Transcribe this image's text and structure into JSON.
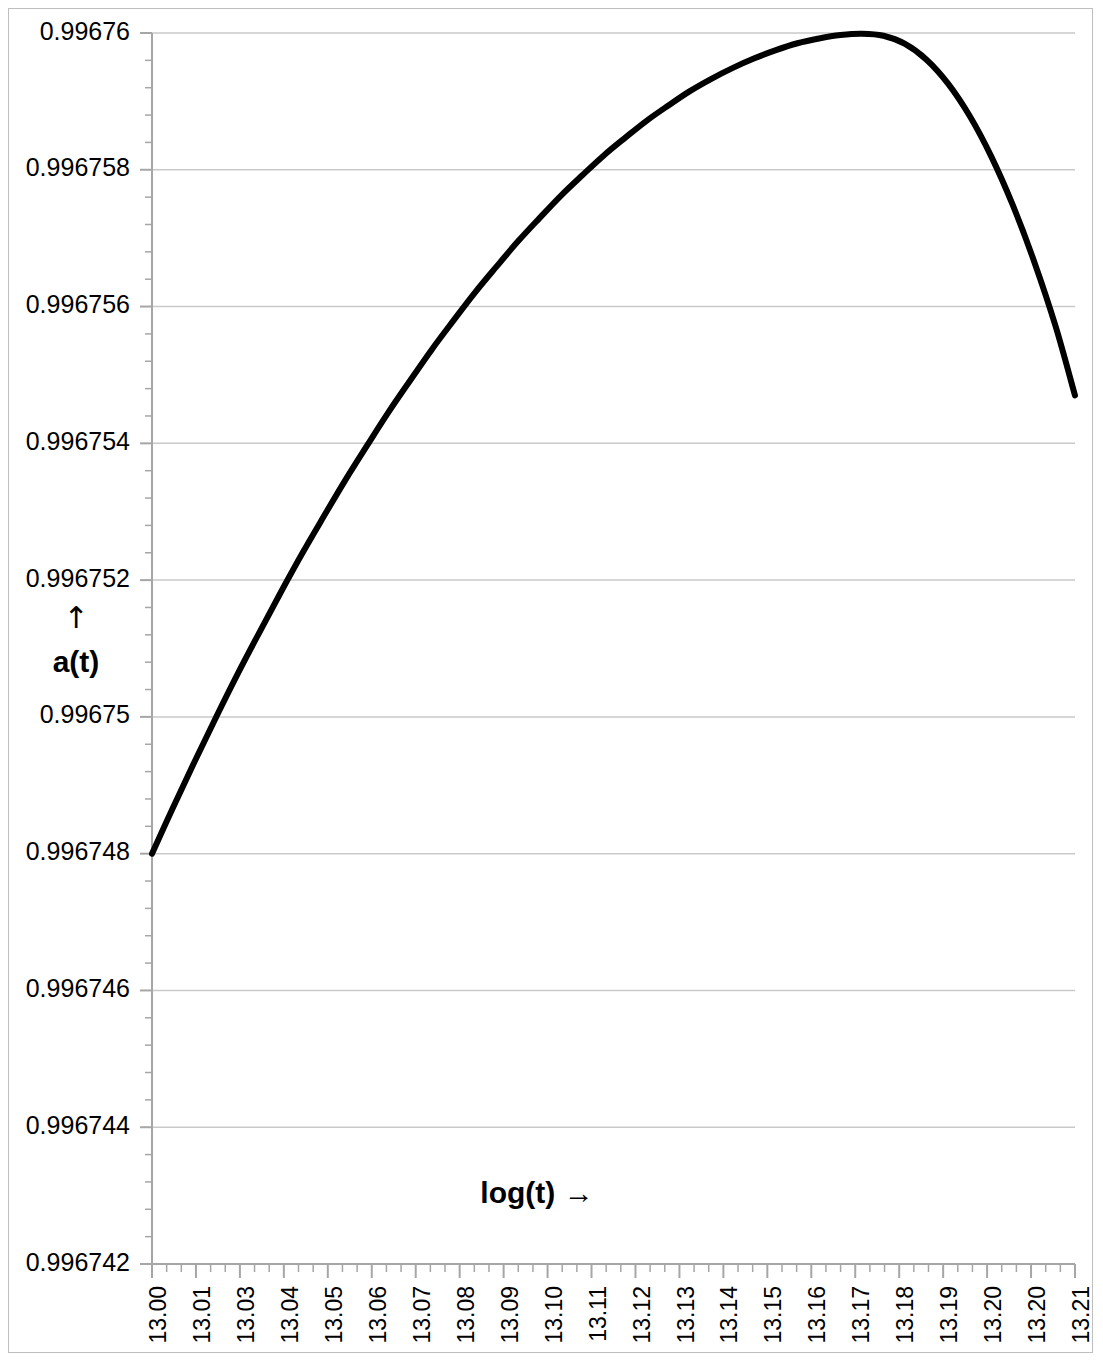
{
  "chart_data": {
    "type": "line",
    "title": "",
    "xlabel": "log(t) →",
    "ylabel": "a(t)",
    "ylabel_arrow": "↑",
    "grid": true,
    "legend": null,
    "xlim": [
      13.0,
      13.2145
    ],
    "ylim": [
      0.996742,
      0.99676
    ],
    "y_tick_labels": [
      "0.99676",
      "0.996758",
      "0.996756",
      "0.996754",
      "0.996752",
      "0.99675",
      "0.996748",
      "0.996746",
      "0.996744",
      "0.996742"
    ],
    "y_tick_values": [
      0.99676,
      0.996758,
      0.996756,
      0.996754,
      0.996752,
      0.99675,
      0.996748,
      0.996746,
      0.996744,
      0.996742
    ],
    "x_tick_labels": [
      "13.00",
      "13.01",
      "13.03",
      "13.04",
      "13.05",
      "13.06",
      "13.07",
      "13.08",
      "13.09",
      "13.10",
      "13.11",
      "13.12",
      "13.13",
      "13.14",
      "13.15",
      "13.16",
      "13.17",
      "13.18",
      "13.19",
      "13.20",
      "13.20",
      "13.21"
    ],
    "minor_ticks_per_interval": 2,
    "line_color": "#000000",
    "line_width_px": 6,
    "grid_color": "#c9c9c9",
    "axis_color": "#a6a6a6",
    "border_color": "#bfbfbf",
    "background_color": "#ffffff",
    "x": [
      13.0,
      13.005,
      13.01,
      13.015,
      13.02,
      13.025,
      13.03,
      13.035,
      13.04,
      13.045,
      13.05,
      13.055,
      13.06,
      13.065,
      13.07,
      13.075,
      13.08,
      13.085,
      13.09,
      13.095,
      13.1,
      13.105,
      13.11,
      13.115,
      13.12,
      13.125,
      13.13,
      13.135,
      13.14,
      13.145,
      13.15,
      13.155,
      13.16,
      13.165,
      13.17,
      13.175,
      13.18,
      13.185,
      13.19,
      13.195,
      13.2,
      13.205,
      13.21,
      13.2145
    ],
    "y": [
      0.996748,
      0.99674869,
      0.99674936,
      0.99675001,
      0.99675064,
      0.99675124,
      0.99675183,
      0.9967524,
      0.99675294,
      0.99675347,
      0.99675397,
      0.99675446,
      0.99675492,
      0.99675537,
      0.99675579,
      0.9967562,
      0.99675658,
      0.99675695,
      0.99675729,
      0.99675762,
      0.99675792,
      0.99675821,
      0.99675847,
      0.99675872,
      0.99675894,
      0.99675915,
      0.99675933,
      0.99675949,
      0.99675963,
      0.99675975,
      0.99675985,
      0.99675992,
      0.99675997,
      0.99675999,
      0.99675996,
      0.99675984,
      0.99675961,
      0.99675926,
      0.99675879,
      0.9967582,
      0.99675749,
      0.99675666,
      0.99675571,
      0.9967547
    ],
    "peak": {
      "x": 13.165,
      "y": 0.9967574
    },
    "start_point": {
      "x": 13.0,
      "y": 0.996748
    },
    "end_point": {
      "x": 13.2145,
      "y": 0.9967512
    },
    "annotations": []
  }
}
